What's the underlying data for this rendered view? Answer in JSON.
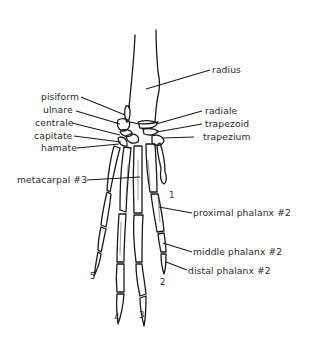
{
  "diagram": {
    "colors": {
      "ink": "#1a1a1a",
      "label": "#2a2a2a",
      "background": "#ffffff"
    },
    "labels_left": [
      {
        "id": "pisiform",
        "text": "pisiform"
      },
      {
        "id": "ulnare",
        "text": "ulnare"
      },
      {
        "id": "centrale",
        "text": "centrale"
      },
      {
        "id": "capitate",
        "text": "capitate"
      },
      {
        "id": "hamate",
        "text": "hamate"
      },
      {
        "id": "metacarpal3",
        "text": "metacarpal #3"
      }
    ],
    "labels_right": [
      {
        "id": "radius",
        "text": "radius"
      },
      {
        "id": "radiale",
        "text": "radiale"
      },
      {
        "id": "trapezoid",
        "text": "trapezoid"
      },
      {
        "id": "trapezium",
        "text": "trapezium"
      },
      {
        "id": "proximal-phalanx-2",
        "text": "proximal phalanx #2"
      },
      {
        "id": "middle-phalanx-2",
        "text": "middle phalanx #2"
      },
      {
        "id": "distal-phalanx-2",
        "text": "distal phalanx #2"
      }
    ],
    "digit_numbers": [
      "1",
      "2",
      "3",
      "4",
      "5"
    ]
  }
}
